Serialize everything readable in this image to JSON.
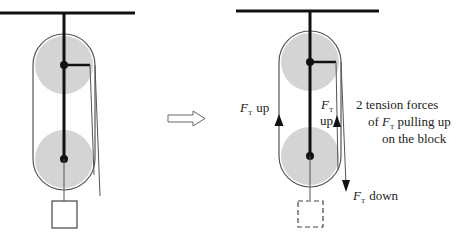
{
  "colors": {
    "line": "#111111",
    "rope": "#444444",
    "pulley_fill": "#d4d4d4",
    "outline": "#555555",
    "arrow_outline": "#666666",
    "background": "#ffffff"
  },
  "left_diagram": {
    "name": "pulley system",
    "block": "solid square block"
  },
  "transition_arrow": "hollow-right-arrow",
  "right_diagram": {
    "labels": {
      "ft_symbol": "F",
      "ft_subscript": "T",
      "left_up": "up",
      "inner_up": "up",
      "down": "down"
    },
    "annotation": {
      "line1": "2  tension forces",
      "line2_prefix": "of ",
      "line2_symbol": "F",
      "line2_subscript": "T",
      "line2_suffix": " pulling up",
      "line3": "on the block"
    },
    "block": "dashed square block"
  }
}
